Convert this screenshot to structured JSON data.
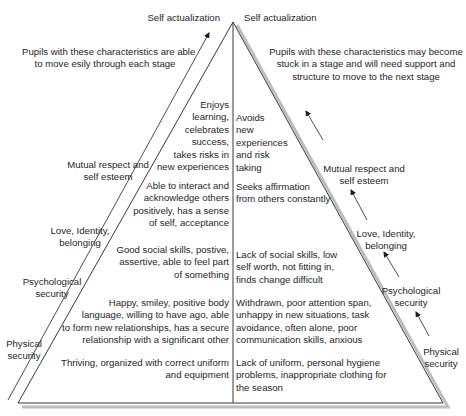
{
  "diagram": {
    "type": "pyramid",
    "apex_labels": {
      "left": "Self actualization",
      "right": "Self actualization"
    },
    "side_notes": {
      "left": [
        "Pupils with these characteristics are able",
        "to move esily through each stage"
      ],
      "right": [
        "Pupils with these characteristics may become",
        "stuck in a stage and will need support and",
        "structure to move to the next stage"
      ]
    },
    "stages_left": [
      {
        "name": "Mutual respect and self esteem",
        "lines": [
          "Mutual respect and",
          "self esteem"
        ]
      },
      {
        "name": "Love, Identity, belonging",
        "lines": [
          "Love, Identity,",
          "belonging"
        ]
      },
      {
        "name": "Psychological security",
        "lines": [
          "Psychological",
          "security"
        ]
      },
      {
        "name": "Physical security",
        "lines": [
          "Physical",
          "security"
        ]
      }
    ],
    "stages_right": [
      {
        "name": "Mutual respect and self esteem",
        "lines": [
          "Mutual respect and",
          "self esteem"
        ]
      },
      {
        "name": "Love, Identity, belonging",
        "lines": [
          "Love, Identity,",
          "belonging"
        ]
      },
      {
        "name": "Psychological security",
        "lines": [
          "Psychological",
          "security"
        ]
      },
      {
        "name": "Physical security",
        "lines": [
          "Physical",
          "security"
        ]
      }
    ],
    "positive_traits": [
      {
        "stage": "Self actualization",
        "lines": [
          "Enjoys",
          "learning,",
          "celebrates",
          "success,",
          "takes risks in",
          "new experiences"
        ]
      },
      {
        "stage": "Mutual respect and self esteem",
        "lines": [
          "Able to interact and",
          "acknowledge others",
          "positively, has a sense",
          "of self, acceptance"
        ]
      },
      {
        "stage": "Love, Identity, belonging",
        "lines": [
          "Good social skills, postive,",
          "assertive, able to feel part",
          "of something"
        ]
      },
      {
        "stage": "Psychological security",
        "lines": [
          "Happy, smiley, positive body",
          "language, willing to have ago, able",
          "to form new relationships, has a secure",
          "relationship with a significant other"
        ]
      },
      {
        "stage": "Physical security",
        "lines": [
          "Thriving, organized with correct uniform",
          "and equipment"
        ]
      }
    ],
    "negative_traits": [
      {
        "stage": "Self actualization",
        "lines": [
          "Avoids",
          "new",
          "experiences",
          "and risk",
          "taking"
        ]
      },
      {
        "stage": "Mutual respect and self esteem",
        "lines": [
          "Seeks affirmation",
          "from others constantly"
        ]
      },
      {
        "stage": "Love, Identity, belonging",
        "lines": [
          "Lack of social skills, low",
          "self worth, not fitting in,",
          "finds change difficult"
        ]
      },
      {
        "stage": "Psychological security",
        "lines": [
          "Withdrawn, poor attention span,",
          "unhappy in new situations, task",
          "avoidance, often alone, poor",
          "communication skills, anxious"
        ]
      },
      {
        "stage": "Physical security",
        "lines": [
          "Lack of uniform, personal hygiene",
          "problems, inappropriate clothing for",
          "the season"
        ]
      }
    ],
    "colors": {
      "line": "#3a3a3a",
      "shadow": "#b8b8b8",
      "text": "#262626"
    }
  }
}
